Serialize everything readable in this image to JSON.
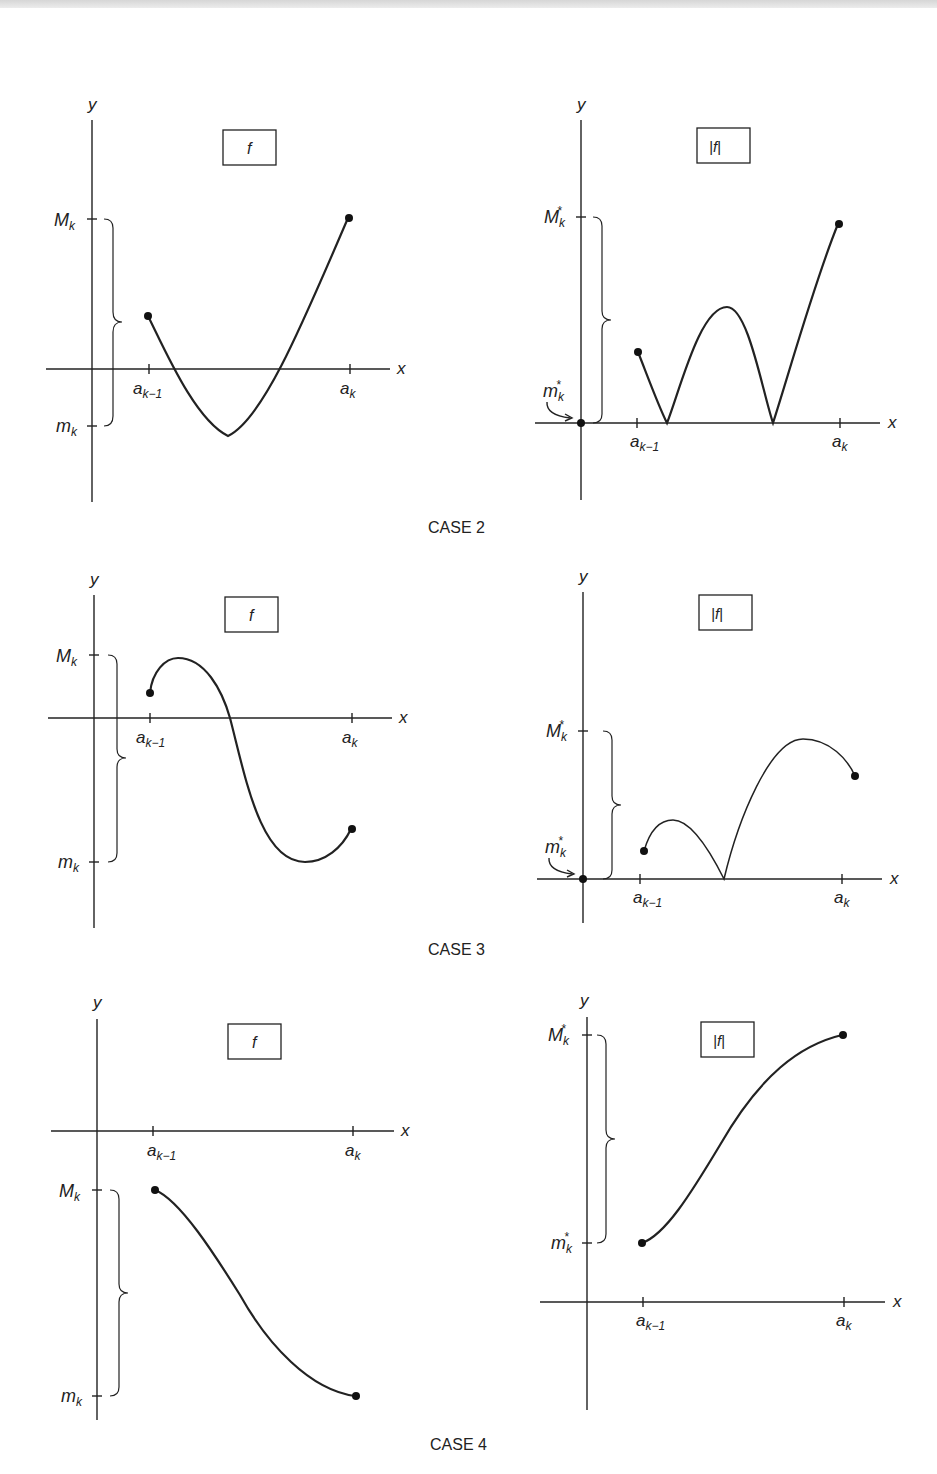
{
  "figure": {
    "cases": [
      {
        "caption": "CASE 2",
        "left": {
          "box_label": "f",
          "y_axis": "y",
          "x_axis": "x",
          "upper": "M",
          "upper_sub": "k",
          "lower": "m",
          "lower_sub": "k",
          "tick_left": "a",
          "tick_left_sub": "k−1",
          "tick_right": "a",
          "tick_right_sub": "k"
        },
        "right": {
          "box_label": "|f|",
          "y_axis": "y",
          "x_axis": "x",
          "upper": "M",
          "upper_sub": "k",
          "upper_sup": "*",
          "lower": "m",
          "lower_sub": "k",
          "lower_sup": "*",
          "tick_left": "a",
          "tick_left_sub": "k−1",
          "tick_right": "a",
          "tick_right_sub": "k"
        }
      },
      {
        "caption": "CASE 3",
        "left": {
          "box_label": "f",
          "y_axis": "y",
          "x_axis": "x",
          "upper": "M",
          "upper_sub": "k",
          "lower": "m",
          "lower_sub": "k",
          "tick_left": "a",
          "tick_left_sub": "k−1",
          "tick_right": "a",
          "tick_right_sub": "k"
        },
        "right": {
          "box_label": "|f|",
          "y_axis": "y",
          "x_axis": "x",
          "upper": "M",
          "upper_sub": "k",
          "upper_sup": "*",
          "lower": "m",
          "lower_sub": "k",
          "lower_sup": "*",
          "tick_left": "a",
          "tick_left_sub": "k−1",
          "tick_right": "a",
          "tick_right_sub": "k"
        }
      },
      {
        "caption": "CASE 4",
        "left": {
          "box_label": "f",
          "y_axis": "y",
          "x_axis": "x",
          "upper": "M",
          "upper_sub": "k",
          "lower": "m",
          "lower_sub": "k",
          "tick_left": "a",
          "tick_left_sub": "k−1",
          "tick_right": "a",
          "tick_right_sub": "k"
        },
        "right": {
          "box_label": "|f|",
          "y_axis": "y",
          "x_axis": "x",
          "upper": "M",
          "upper_sub": "k",
          "upper_sup": "*",
          "lower": "m",
          "lower_sub": "k",
          "lower_sup": "*",
          "tick_left": "a",
          "tick_left_sub": "k−1",
          "tick_right": "a",
          "tick_right_sub": "k"
        }
      }
    ]
  }
}
